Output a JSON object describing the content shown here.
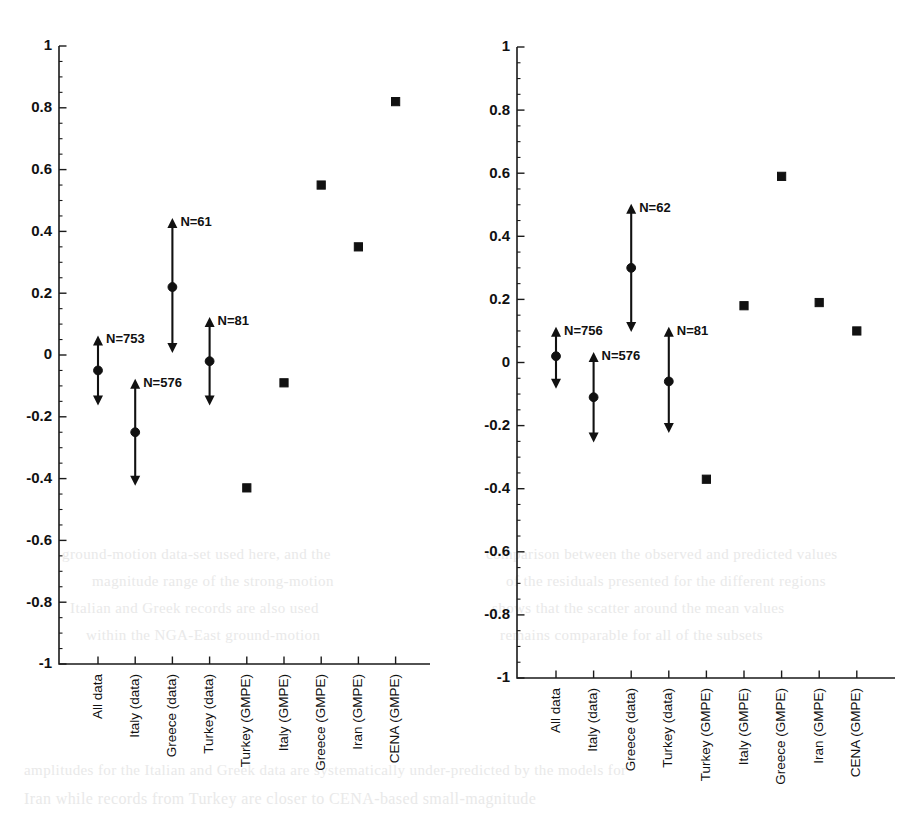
{
  "figure": {
    "background": "#ffffff",
    "ink_color": "#111111",
    "panels": [
      {
        "id": "panel-left",
        "name": "left-panel"
      },
      {
        "id": "panel-right",
        "name": "right-panel"
      }
    ]
  },
  "axis": {
    "y_label": "",
    "y_ticks": [
      "1",
      "0.8",
      "0.6",
      "0.4",
      "0.2",
      "0",
      "-0.2",
      "-0.4",
      "-0.6",
      "-0.8",
      "-1"
    ],
    "y_tick_values": [
      1,
      0.8,
      0.6,
      0.4,
      0.2,
      0,
      -0.2,
      -0.4,
      -0.6,
      -0.8,
      -1
    ],
    "y_min": -1,
    "y_max": 1,
    "minor_tick_step": 0.05,
    "x_categories": [
      "All data",
      "Italy (data)",
      "Greece (data)",
      "Turkey (data)",
      "Turkey (GMPE)",
      "Italy (GMPE)",
      "Greece (GMPE)",
      "Iran (GMPE)",
      "CENA (GMPE)"
    ],
    "grid": false,
    "legend": "none"
  },
  "chart_data": [
    {
      "type": "scatter",
      "title": "",
      "subtitle": "",
      "panel": "left",
      "xlabel": "",
      "ylabel": "",
      "ylim": [
        -1,
        1
      ],
      "yticks": [
        1,
        0.8,
        0.6,
        0.4,
        0.2,
        0,
        -0.2,
        -0.4,
        -0.6,
        -0.8,
        -1
      ],
      "grid": false,
      "legend_position": "none",
      "categories": [
        "All data",
        "Italy (data)",
        "Greece (data)",
        "Turkey (data)",
        "Turkey (GMPE)",
        "Italy (GMPE)",
        "Greece (GMPE)",
        "Iran (GMPE)",
        "CENA (GMPE)"
      ],
      "series": [
        {
          "name": "data (mean with range)",
          "marker": "circle",
          "points": [
            {
              "category": "All data",
              "value": -0.05,
              "upper": 0.06,
              "lower": -0.16,
              "annotation": "N=753"
            },
            {
              "category": "Italy (data)",
              "value": -0.25,
              "upper": -0.08,
              "lower": -0.42,
              "annotation": "N=576"
            },
            {
              "category": "Greece (data)",
              "value": 0.22,
              "upper": 0.44,
              "lower": 0.01,
              "annotation": "N=61"
            },
            {
              "category": "Turkey (data)",
              "value": -0.02,
              "upper": 0.12,
              "lower": -0.16,
              "annotation": "N=81"
            }
          ]
        },
        {
          "name": "GMPE",
          "marker": "square",
          "points": [
            {
              "category": "Turkey (GMPE)",
              "value": -0.43
            },
            {
              "category": "Italy (GMPE)",
              "value": -0.09
            },
            {
              "category": "Greece (GMPE)",
              "value": 0.55
            },
            {
              "category": "Iran (GMPE)",
              "value": 0.35
            },
            {
              "category": "CENA (GMPE)",
              "value": 0.82
            }
          ]
        }
      ]
    },
    {
      "type": "scatter",
      "title": "",
      "subtitle": "",
      "panel": "right",
      "xlabel": "",
      "ylabel": "",
      "ylim": [
        -1,
        1
      ],
      "yticks": [
        1,
        0.8,
        0.6,
        0.4,
        0.2,
        0,
        -0.2,
        -0.4,
        -0.6,
        -0.8,
        -1
      ],
      "grid": false,
      "legend_position": "none",
      "categories": [
        "All data",
        "Italy (data)",
        "Greece (data)",
        "Turkey (data)",
        "Turkey (GMPE)",
        "Italy (GMPE)",
        "Greece (GMPE)",
        "Iran (GMPE)",
        "CENA (GMPE)"
      ],
      "series": [
        {
          "name": "data (mean with range)",
          "marker": "circle",
          "points": [
            {
              "category": "All data",
              "value": 0.02,
              "upper": 0.11,
              "lower": -0.08,
              "annotation": "N=756"
            },
            {
              "category": "Italy (data)",
              "value": -0.11,
              "upper": 0.03,
              "lower": -0.25,
              "annotation": "N=576"
            },
            {
              "category": "Greece (data)",
              "value": 0.3,
              "upper": 0.5,
              "lower": 0.1,
              "annotation": "N=62"
            },
            {
              "category": "Turkey (data)",
              "value": -0.06,
              "upper": 0.11,
              "lower": -0.22,
              "annotation": "N=81"
            }
          ]
        },
        {
          "name": "GMPE",
          "marker": "square",
          "points": [
            {
              "category": "Turkey (GMPE)",
              "value": -0.37
            },
            {
              "category": "Italy (GMPE)",
              "value": 0.18
            },
            {
              "category": "Greece (GMPE)",
              "value": 0.59
            },
            {
              "category": "Iran (GMPE)",
              "value": 0.19
            },
            {
              "category": "CENA (GMPE)",
              "value": 0.1
            }
          ]
        }
      ]
    }
  ],
  "ghost_lines": [
    {
      "text": "ground-motion data-set used here, and the",
      "x": 62,
      "y": 546,
      "size": 15
    },
    {
      "text": "magnitude range of the strong-motion",
      "x": 92,
      "y": 573,
      "size": 15
    },
    {
      "text": "Italian and Greek records are also used",
      "x": 70,
      "y": 600,
      "size": 15
    },
    {
      "text": "within the NGA-East ground-motion",
      "x": 86,
      "y": 627,
      "size": 15
    },
    {
      "text": "comparison between the observed and predicted values",
      "x": 486,
      "y": 546,
      "size": 15
    },
    {
      "text": "of the residuals presented for the different regions",
      "x": 506,
      "y": 573,
      "size": 15
    },
    {
      "text": "shows that the scatter around the mean values",
      "x": 492,
      "y": 600,
      "size": 15
    },
    {
      "text": "remains comparable for all of the subsets",
      "x": 500,
      "y": 627,
      "size": 15
    },
    {
      "text": "amplitudes for the Italian and Greek data are systematically under-predicted by the models for",
      "x": 24,
      "y": 762,
      "size": 15
    },
    {
      "text": "Iran while records from Turkey are closer to CENA-based small-magnitude",
      "x": 24,
      "y": 790,
      "size": 16
    }
  ]
}
